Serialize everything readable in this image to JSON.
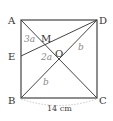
{
  "diagram": {
    "type": "geometry-square",
    "points": {
      "A": {
        "label": "A",
        "x": 21,
        "y": 20
      },
      "D": {
        "label": "D",
        "x": 97,
        "y": 20
      },
      "B": {
        "label": "B",
        "x": 21,
        "y": 98
      },
      "C": {
        "label": "C",
        "x": 97,
        "y": 98
      },
      "E": {
        "label": "E",
        "x": 21,
        "y": 56
      },
      "M": {
        "label": "M",
        "x": 42,
        "y": 44
      },
      "O": {
        "label": "O",
        "x": 59,
        "y": 59
      }
    },
    "segment_labels": {
      "AM": "3a",
      "MO": "2a",
      "OD": "b",
      "BO": "b"
    },
    "dimension": {
      "label": "14 cm",
      "side": "BC"
    },
    "colors": {
      "line": "#444444",
      "dim_arc": "#bbbbbb",
      "var_text": "#888888"
    }
  }
}
